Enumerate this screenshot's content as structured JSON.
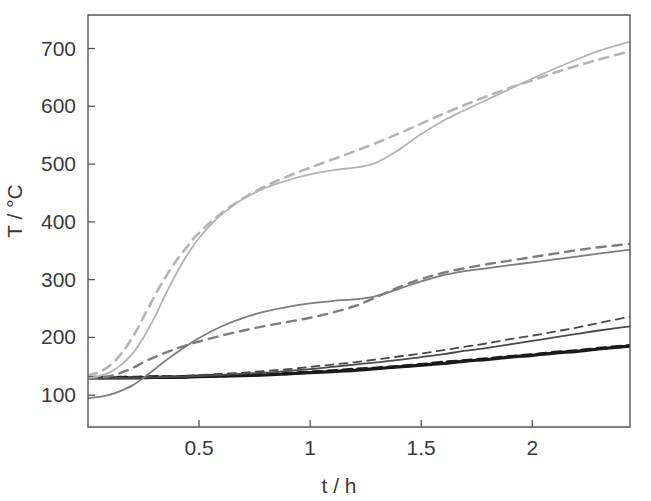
{
  "figure": {
    "background": "#ffffff",
    "plot_box": {
      "left": 88,
      "top": 15,
      "right": 630,
      "bottom": 427
    }
  },
  "chart_data": {
    "type": "line",
    "title": "",
    "subtitle": "",
    "xlabel": "t / h",
    "ylabel": "T / °C",
    "xlim": [
      0,
      2.44
    ],
    "ylim": [
      45,
      758
    ],
    "xticks": [
      0.5,
      1,
      1.5,
      2
    ],
    "xtick_labels": [
      "0.5",
      "1",
      "1.5",
      "2"
    ],
    "yticks": [
      100,
      200,
      300,
      400,
      500,
      600,
      700
    ],
    "ytick_labels": [
      "100",
      "200",
      "300",
      "400",
      "500",
      "600",
      "700"
    ],
    "grid": false,
    "legend": "none",
    "annotations": [],
    "colors": {
      "black": "#1a1a1a",
      "dark_gray": "#4a4a4a",
      "mid_gray": "#7d7d7d",
      "light_gray": "#b4b4b4"
    },
    "series": [
      {
        "name": "Position 1 measured (solid black)",
        "style": "solid",
        "color": "#1a1a1a",
        "width": 3.2,
        "x": [
          0.0,
          0.1,
          0.2,
          0.3,
          0.4,
          0.5,
          0.6,
          0.7,
          0.8,
          0.9,
          1.0,
          1.1,
          1.2,
          1.3,
          1.4,
          1.5,
          1.6,
          1.7,
          1.8,
          1.9,
          2.0,
          2.1,
          2.2,
          2.3,
          2.44
        ],
        "y": [
          130,
          130,
          130,
          131,
          131,
          132,
          133,
          134,
          135,
          137,
          139,
          141,
          143,
          146,
          149,
          152,
          155,
          159,
          162,
          166,
          169,
          173,
          176,
          180,
          185
        ]
      },
      {
        "name": "Position 1 simulated (dashed black)",
        "style": "dashed",
        "color": "#1a1a1a",
        "width": 3.2,
        "x": [
          0.0,
          0.1,
          0.2,
          0.3,
          0.4,
          0.5,
          0.6,
          0.7,
          0.8,
          0.9,
          1.0,
          1.1,
          1.2,
          1.3,
          1.4,
          1.5,
          1.6,
          1.7,
          1.8,
          1.9,
          2.0,
          2.1,
          2.2,
          2.3,
          2.44
        ],
        "y": [
          131,
          131,
          131,
          132,
          132,
          133,
          134,
          135,
          137,
          138,
          140,
          142,
          145,
          147,
          150,
          153,
          157,
          160,
          163,
          167,
          170,
          174,
          177,
          181,
          186
        ]
      },
      {
        "name": "Position 2 measured (solid dark gray)",
        "style": "solid",
        "color": "#4a4a4a",
        "width": 1.8,
        "x": [
          0.0,
          0.1,
          0.2,
          0.3,
          0.4,
          0.5,
          0.6,
          0.7,
          0.8,
          0.9,
          1.0,
          1.1,
          1.2,
          1.3,
          1.4,
          1.5,
          1.6,
          1.7,
          1.8,
          1.9,
          2.0,
          2.1,
          2.2,
          2.3,
          2.44
        ],
        "y": [
          129,
          129,
          130,
          131,
          132,
          133,
          135,
          137,
          139,
          142,
          145,
          149,
          153,
          157,
          161,
          166,
          171,
          177,
          182,
          188,
          194,
          200,
          206,
          212,
          219
        ]
      },
      {
        "name": "Position 2 simulated (dashed dark gray)",
        "style": "dashed",
        "color": "#4a4a4a",
        "width": 1.8,
        "x": [
          0.0,
          0.1,
          0.2,
          0.3,
          0.4,
          0.5,
          0.6,
          0.7,
          0.8,
          0.9,
          1.0,
          1.1,
          1.2,
          1.3,
          1.4,
          1.5,
          1.6,
          1.7,
          1.8,
          1.9,
          2.0,
          2.1,
          2.2,
          2.3,
          2.44
        ],
        "y": [
          130,
          130,
          131,
          132,
          133,
          135,
          137,
          139,
          142,
          145,
          149,
          153,
          157,
          162,
          167,
          172,
          178,
          184,
          190,
          197,
          203,
          210,
          217,
          225,
          236
        ]
      },
      {
        "name": "Position 3 measured (solid mid gray)",
        "style": "solid",
        "color": "#7d7d7d",
        "width": 1.8,
        "x": [
          0.0,
          0.05,
          0.1,
          0.15,
          0.2,
          0.25,
          0.3,
          0.35,
          0.4,
          0.5,
          0.6,
          0.7,
          0.8,
          0.9,
          1.0,
          1.1,
          1.2,
          1.25,
          1.3,
          1.4,
          1.5,
          1.6,
          1.7,
          1.8,
          1.9,
          2.0,
          2.1,
          2.2,
          2.3,
          2.44
        ],
        "y": [
          95,
          97,
          101,
          108,
          117,
          130,
          145,
          160,
          174,
          199,
          219,
          234,
          245,
          253,
          259,
          263,
          266,
          268,
          272,
          284,
          297,
          308,
          315,
          320,
          325,
          330,
          335,
          340,
          345,
          352
        ]
      },
      {
        "name": "Position 3 simulated (dashed mid gray)",
        "style": "dashed",
        "color": "#7d7d7d",
        "width": 2.4,
        "x": [
          0.0,
          0.05,
          0.1,
          0.15,
          0.2,
          0.25,
          0.3,
          0.4,
          0.5,
          0.6,
          0.7,
          0.8,
          0.9,
          1.0,
          1.1,
          1.2,
          1.3,
          1.4,
          1.5,
          1.6,
          1.7,
          1.8,
          1.9,
          2.0,
          2.1,
          2.2,
          2.3,
          2.44
        ],
        "y": [
          129,
          130,
          133,
          139,
          147,
          157,
          166,
          181,
          193,
          203,
          212,
          220,
          227,
          234,
          243,
          254,
          270,
          287,
          301,
          312,
          320,
          327,
          333,
          339,
          345,
          351,
          356,
          362
        ]
      },
      {
        "name": "Position 4 measured (solid light gray)",
        "style": "solid",
        "color": "#b4b4b4",
        "width": 1.8,
        "x": [
          0.0,
          0.05,
          0.1,
          0.15,
          0.2,
          0.25,
          0.3,
          0.35,
          0.4,
          0.45,
          0.5,
          0.55,
          0.6,
          0.65,
          0.7,
          0.8,
          0.9,
          1.0,
          1.1,
          1.2,
          1.25,
          1.3,
          1.4,
          1.5,
          1.6,
          1.7,
          1.8,
          1.9,
          2.0,
          2.1,
          2.2,
          2.3,
          2.44
        ],
        "y": [
          130,
          133,
          140,
          153,
          172,
          200,
          235,
          275,
          312,
          345,
          372,
          394,
          412,
          427,
          440,
          459,
          472,
          482,
          489,
          494,
          497,
          503,
          525,
          552,
          575,
          594,
          612,
          630,
          648,
          665,
          681,
          696,
          712
        ]
      },
      {
        "name": "Position 4 simulated (dashed light gray)",
        "style": "dashed",
        "color": "#b4b4b4",
        "width": 2.6,
        "x": [
          0.0,
          0.05,
          0.1,
          0.15,
          0.2,
          0.25,
          0.3,
          0.35,
          0.4,
          0.45,
          0.5,
          0.6,
          0.7,
          0.8,
          0.9,
          1.0,
          1.1,
          1.2,
          1.3,
          1.4,
          1.5,
          1.6,
          1.7,
          1.8,
          1.9,
          2.0,
          2.1,
          2.2,
          2.3,
          2.44
        ],
        "y": [
          134,
          140,
          152,
          172,
          200,
          235,
          272,
          305,
          334,
          359,
          381,
          415,
          441,
          462,
          479,
          494,
          508,
          522,
          537,
          553,
          570,
          587,
          603,
          618,
          632,
          645,
          658,
          670,
          681,
          695
        ]
      }
    ]
  }
}
